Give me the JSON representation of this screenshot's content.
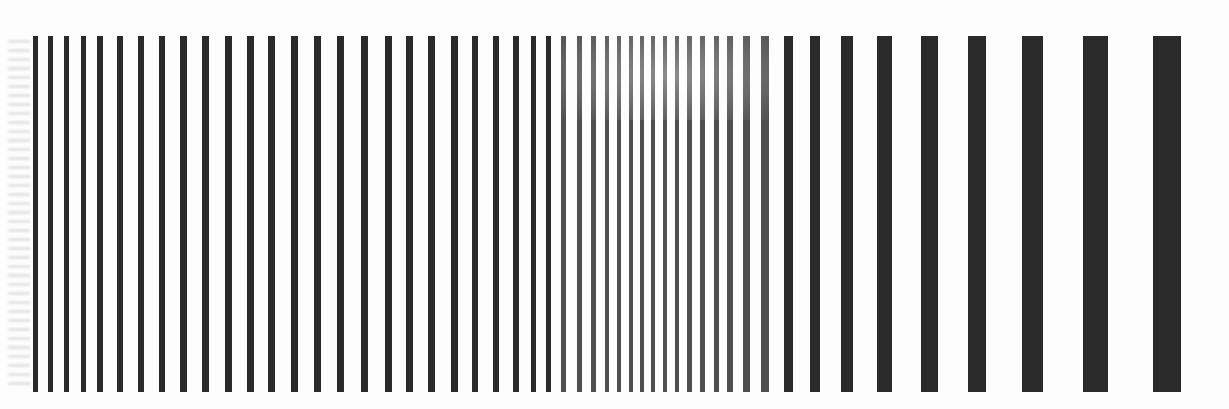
{
  "image": {
    "description": "Photographed line-pair resolution test pattern: black vertical bars on white, spacing and width increasing from left to right",
    "background": "#fdfdfd",
    "bar_color": "#2a2a2a",
    "bar_top": 36,
    "bar_bottom": 392
  },
  "bars": [
    {
      "x": 35,
      "w": 5
    },
    {
      "x": 50,
      "w": 5
    },
    {
      "x": 66,
      "w": 5
    },
    {
      "x": 83,
      "w": 5
    },
    {
      "x": 100,
      "w": 6
    },
    {
      "x": 120,
      "w": 6
    },
    {
      "x": 141,
      "w": 6
    },
    {
      "x": 162,
      "w": 6
    },
    {
      "x": 183,
      "w": 7
    },
    {
      "x": 205,
      "w": 7
    },
    {
      "x": 228,
      "w": 7
    },
    {
      "x": 250,
      "w": 7
    },
    {
      "x": 271,
      "w": 7
    },
    {
      "x": 294,
      "w": 7
    },
    {
      "x": 317,
      "w": 7
    },
    {
      "x": 340,
      "w": 7
    },
    {
      "x": 364,
      "w": 7
    },
    {
      "x": 388,
      "w": 7
    },
    {
      "x": 409,
      "w": 7
    },
    {
      "x": 431,
      "w": 7
    },
    {
      "x": 454,
      "w": 7
    },
    {
      "x": 475,
      "w": 6
    },
    {
      "x": 496,
      "w": 6
    },
    {
      "x": 516,
      "w": 6
    },
    {
      "x": 533,
      "w": 5
    },
    {
      "x": 548,
      "w": 5
    },
    {
      "x": 563,
      "w": 5
    },
    {
      "x": 579,
      "w": 5
    },
    {
      "x": 593,
      "w": 5
    },
    {
      "x": 607,
      "w": 4
    },
    {
      "x": 619,
      "w": 4
    },
    {
      "x": 631,
      "w": 4
    },
    {
      "x": 642,
      "w": 4
    },
    {
      "x": 653,
      "w": 4
    },
    {
      "x": 665,
      "w": 4
    },
    {
      "x": 677,
      "w": 4
    },
    {
      "x": 689,
      "w": 5
    },
    {
      "x": 702,
      "w": 5
    },
    {
      "x": 716,
      "w": 5
    },
    {
      "x": 730,
      "w": 6
    },
    {
      "x": 746,
      "w": 7
    },
    {
      "x": 765,
      "w": 8
    },
    {
      "x": 788,
      "w": 9
    },
    {
      "x": 815,
      "w": 10
    },
    {
      "x": 847,
      "w": 12
    },
    {
      "x": 884,
      "w": 15
    },
    {
      "x": 929,
      "w": 17
    },
    {
      "x": 977,
      "w": 18
    },
    {
      "x": 1032,
      "w": 21
    },
    {
      "x": 1095,
      "w": 25
    },
    {
      "x": 1167,
      "w": 28
    }
  ]
}
